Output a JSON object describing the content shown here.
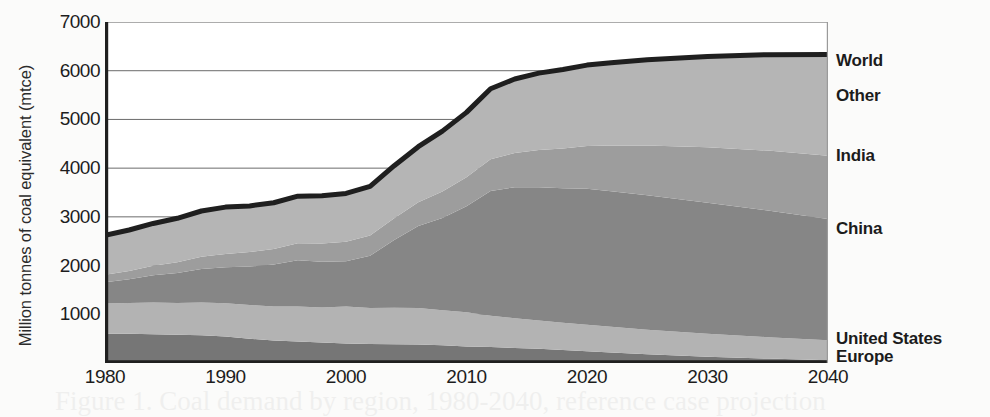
{
  "chart_data": {
    "type": "area",
    "stacked": true,
    "title": "",
    "xlabel": "",
    "ylabel": "Million tonnes of coal equivalent (mtce)",
    "xlim": [
      1980,
      2040
    ],
    "ylim": [
      0,
      7000
    ],
    "xticks": [
      "1980",
      "1990",
      "2000",
      "2010",
      "2020",
      "2030",
      "2040"
    ],
    "yticks": [
      "1000",
      "2000",
      "3000",
      "4000",
      "5000",
      "6000",
      "7000"
    ],
    "grid": true,
    "legend_position": "right-inline",
    "x": [
      1980,
      1982,
      1984,
      1986,
      1988,
      1990,
      1992,
      1994,
      1996,
      1998,
      2000,
      2002,
      2004,
      2006,
      2008,
      2010,
      2012,
      2014,
      2016,
      2018,
      2020,
      2022,
      2025,
      2030,
      2035,
      2040
    ],
    "series": [
      {
        "name": "Europe",
        "color": "#767676",
        "values": [
          600,
          600,
          590,
          580,
          570,
          545,
          500,
          460,
          440,
          420,
          400,
          390,
          385,
          380,
          365,
          340,
          330,
          310,
          290,
          265,
          240,
          215,
          180,
          130,
          90,
          55
        ]
      },
      {
        "name": "United States",
        "color": "#b3b3b3",
        "values": [
          620,
          630,
          650,
          650,
          670,
          680,
          690,
          700,
          720,
          720,
          760,
          740,
          750,
          750,
          720,
          700,
          640,
          610,
          580,
          560,
          545,
          530,
          505,
          470,
          440,
          410
        ]
      },
      {
        "name": "China",
        "color": "#868686",
        "values": [
          440,
          490,
          560,
          620,
          690,
          740,
          790,
          860,
          950,
          940,
          930,
          1070,
          1390,
          1680,
          1890,
          2180,
          2560,
          2690,
          2740,
          2760,
          2790,
          2780,
          2760,
          2690,
          2600,
          2490
        ]
      },
      {
        "name": "India",
        "color": "#9d9d9d",
        "values": [
          150,
          170,
          195,
          220,
          250,
          275,
          300,
          320,
          350,
          375,
          400,
          415,
          445,
          490,
          545,
          595,
          650,
          700,
          760,
          820,
          880,
          940,
          1020,
          1140,
          1230,
          1300
        ]
      },
      {
        "name": "Other",
        "color": "#b5b5b5",
        "values": [
          810,
          840,
          870,
          900,
          940,
          960,
          945,
          950,
          965,
          980,
          990,
          1010,
          1080,
          1140,
          1240,
          1330,
          1450,
          1520,
          1580,
          1620,
          1660,
          1700,
          1760,
          1860,
          1970,
          2080
        ]
      }
    ],
    "total_line": {
      "name": "World",
      "color": "#1f1f1f",
      "values": [
        2620,
        2730,
        2865,
        2970,
        3120,
        3200,
        3225,
        3290,
        3425,
        3435,
        3480,
        3625,
        4050,
        4440,
        4760,
        5145,
        5630,
        5830,
        5950,
        6025,
        6115,
        6165,
        6225,
        6290,
        6330,
        6335
      ]
    },
    "annotations": [
      {
        "label": "World",
        "y_value": 6335
      },
      {
        "label": "Other",
        "y_value": 5660
      },
      {
        "label": "India",
        "y_value": 4390
      },
      {
        "label": "China",
        "y_value": 2900
      },
      {
        "label": "United States",
        "y_value": 545
      },
      {
        "label": "Europe",
        "y_value": 150
      }
    ]
  },
  "legend": {
    "items": [
      {
        "label": "World",
        "top": 51
      },
      {
        "label": "Other",
        "top": 86
      },
      {
        "label": "India",
        "top": 146
      },
      {
        "label": "China",
        "top": 219
      },
      {
        "label": "United States",
        "top": 329
      },
      {
        "label": "Europe",
        "top": 347
      }
    ]
  },
  "bleed_text": {
    "line1": "Figure 1.  Coal demand by region, 1980-2040, reference case projection"
  }
}
